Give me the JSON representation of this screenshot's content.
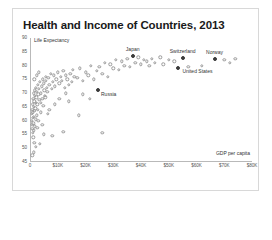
{
  "card": {
    "title": "Health and Income of Countries, 2013"
  },
  "chart_data": {
    "type": "scatter",
    "title": "Health and Income of Countries, 2013",
    "xlabel": "GDP per capita",
    "ylabel": "Life Expectancy",
    "xlim": [
      0,
      80000
    ],
    "ylim": [
      45,
      90
    ],
    "grid": false,
    "legend": "none",
    "xticks": [
      {
        "value": 0,
        "label": "0"
      },
      {
        "value": 10000,
        "label": "$10K"
      },
      {
        "value": 20000,
        "label": "$20K"
      },
      {
        "value": 30000,
        "label": "$30K"
      },
      {
        "value": 40000,
        "label": "$40K"
      },
      {
        "value": 50000,
        "label": "$50K"
      },
      {
        "value": 60000,
        "label": "$60K"
      },
      {
        "value": 70000,
        "label": "$70K"
      },
      {
        "value": 80000,
        "label": "$80K"
      }
    ],
    "yticks": [
      {
        "value": 90,
        "label": "90"
      },
      {
        "value": 85,
        "label": "85"
      },
      {
        "value": 80,
        "label": "80"
      },
      {
        "value": 75,
        "label": "75"
      },
      {
        "value": 70,
        "label": "70"
      },
      {
        "value": 65,
        "label": "65"
      },
      {
        "value": 60,
        "label": "60"
      },
      {
        "value": 55,
        "label": "55"
      },
      {
        "value": 50,
        "label": "50"
      },
      {
        "value": 45,
        "label": "45"
      }
    ],
    "annotations": [
      {
        "name": "Japan",
        "x": 37000,
        "y": 83.5,
        "dx": 0,
        "dy": -6,
        "align": "center"
      },
      {
        "name": "Switzerland",
        "x": 55000,
        "y": 82.8,
        "dx": 0,
        "dy": -6,
        "align": "center"
      },
      {
        "name": "Norway",
        "x": 66500,
        "y": 82.5,
        "dx": 0,
        "dy": -6,
        "align": "center"
      },
      {
        "name": "United States",
        "x": 53500,
        "y": 79.0,
        "dx": 4,
        "dy": 4,
        "align": "left"
      },
      {
        "name": "Russia",
        "x": 24500,
        "y": 71.0,
        "dx": 3,
        "dy": 5,
        "align": "left"
      }
    ],
    "points": [
      {
        "x": 700,
        "y": 62.5
      },
      {
        "x": 750,
        "y": 60.0
      },
      {
        "x": 800,
        "y": 58.5
      },
      {
        "x": 850,
        "y": 64.0
      },
      {
        "x": 900,
        "y": 57.0
      },
      {
        "x": 950,
        "y": 61.0
      },
      {
        "x": 1000,
        "y": 66.0
      },
      {
        "x": 1050,
        "y": 55.5
      },
      {
        "x": 1100,
        "y": 63.0
      },
      {
        "x": 1150,
        "y": 59.0
      },
      {
        "x": 1200,
        "y": 68.0
      },
      {
        "x": 1250,
        "y": 54.0
      },
      {
        "x": 1300,
        "y": 65.0
      },
      {
        "x": 1350,
        "y": 61.5
      },
      {
        "x": 1400,
        "y": 70.0
      },
      {
        "x": 1450,
        "y": 56.5
      },
      {
        "x": 1500,
        "y": 67.0
      },
      {
        "x": 1550,
        "y": 52.0
      },
      {
        "x": 1600,
        "y": 63.5
      },
      {
        "x": 1650,
        "y": 69.0
      },
      {
        "x": 1700,
        "y": 58.0
      },
      {
        "x": 1800,
        "y": 71.0
      },
      {
        "x": 1900,
        "y": 64.5
      },
      {
        "x": 2000,
        "y": 66.5
      },
      {
        "x": 2100,
        "y": 60.5
      },
      {
        "x": 2200,
        "y": 72.0
      },
      {
        "x": 2300,
        "y": 68.5
      },
      {
        "x": 2400,
        "y": 62.0
      },
      {
        "x": 2500,
        "y": 70.5
      },
      {
        "x": 2600,
        "y": 57.5
      },
      {
        "x": 2700,
        "y": 66.0
      },
      {
        "x": 2800,
        "y": 73.0
      },
      {
        "x": 2900,
        "y": 64.0
      },
      {
        "x": 3000,
        "y": 69.5
      },
      {
        "x": 3200,
        "y": 71.5
      },
      {
        "x": 3400,
        "y": 67.5
      },
      {
        "x": 3600,
        "y": 74.0
      },
      {
        "x": 3800,
        "y": 63.0
      },
      {
        "x": 4000,
        "y": 70.0
      },
      {
        "x": 4200,
        "y": 72.5
      },
      {
        "x": 4400,
        "y": 68.0
      },
      {
        "x": 4600,
        "y": 75.0
      },
      {
        "x": 4800,
        "y": 65.5
      },
      {
        "x": 5000,
        "y": 73.5
      },
      {
        "x": 5200,
        "y": 71.0
      },
      {
        "x": 5400,
        "y": 69.0
      },
      {
        "x": 5600,
        "y": 76.0
      },
      {
        "x": 5800,
        "y": 74.5
      },
      {
        "x": 6000,
        "y": 72.0
      },
      {
        "x": 6300,
        "y": 70.5
      },
      {
        "x": 6600,
        "y": 75.5
      },
      {
        "x": 7000,
        "y": 73.0
      },
      {
        "x": 7400,
        "y": 77.0
      },
      {
        "x": 7800,
        "y": 71.5
      },
      {
        "x": 8200,
        "y": 74.0
      },
      {
        "x": 8600,
        "y": 76.5
      },
      {
        "x": 9000,
        "y": 72.5
      },
      {
        "x": 9500,
        "y": 75.0
      },
      {
        "x": 10000,
        "y": 77.5
      },
      {
        "x": 10500,
        "y": 73.5
      },
      {
        "x": 11000,
        "y": 76.0
      },
      {
        "x": 11500,
        "y": 74.5
      },
      {
        "x": 12000,
        "y": 78.0
      },
      {
        "x": 12500,
        "y": 72.0
      },
      {
        "x": 13000,
        "y": 76.5
      },
      {
        "x": 13500,
        "y": 75.0
      },
      {
        "x": 14000,
        "y": 73.0
      },
      {
        "x": 14500,
        "y": 77.0
      },
      {
        "x": 15000,
        "y": 74.0
      },
      {
        "x": 15500,
        "y": 78.5
      },
      {
        "x": 16000,
        "y": 76.0
      },
      {
        "x": 17000,
        "y": 75.5
      },
      {
        "x": 18000,
        "y": 79.0
      },
      {
        "x": 19000,
        "y": 74.5
      },
      {
        "x": 20000,
        "y": 77.5
      },
      {
        "x": 21000,
        "y": 76.5
      },
      {
        "x": 22000,
        "y": 80.0
      },
      {
        "x": 23000,
        "y": 75.0
      },
      {
        "x": 24000,
        "y": 78.0
      },
      {
        "x": 25000,
        "y": 79.5
      },
      {
        "x": 26000,
        "y": 77.0
      },
      {
        "x": 27000,
        "y": 81.0
      },
      {
        "x": 28000,
        "y": 76.0
      },
      {
        "x": 29000,
        "y": 80.5
      },
      {
        "x": 30000,
        "y": 79.0
      },
      {
        "x": 31000,
        "y": 82.0
      },
      {
        "x": 32000,
        "y": 78.5
      },
      {
        "x": 33000,
        "y": 81.5
      },
      {
        "x": 34000,
        "y": 80.0
      },
      {
        "x": 35000,
        "y": 82.5
      },
      {
        "x": 36000,
        "y": 79.5
      },
      {
        "x": 38000,
        "y": 81.0
      },
      {
        "x": 39000,
        "y": 83.0
      },
      {
        "x": 40000,
        "y": 80.5
      },
      {
        "x": 41000,
        "y": 82.0
      },
      {
        "x": 42000,
        "y": 81.5
      },
      {
        "x": 43000,
        "y": 80.0
      },
      {
        "x": 44000,
        "y": 82.5
      },
      {
        "x": 45000,
        "y": 81.0
      },
      {
        "x": 47000,
        "y": 83.0
      },
      {
        "x": 48000,
        "y": 80.5
      },
      {
        "x": 50000,
        "y": 82.0
      },
      {
        "x": 52000,
        "y": 81.5
      },
      {
        "x": 57000,
        "y": 79.5
      },
      {
        "x": 62000,
        "y": 80.0
      },
      {
        "x": 70000,
        "y": 82.0
      },
      {
        "x": 72000,
        "y": 81.0
      },
      {
        "x": 74000,
        "y": 82.5
      },
      {
        "x": 2000,
        "y": 50.5
      },
      {
        "x": 3500,
        "y": 51.5
      },
      {
        "x": 1400,
        "y": 48.5
      },
      {
        "x": 900,
        "y": 47.5
      },
      {
        "x": 5000,
        "y": 55.0
      },
      {
        "x": 8000,
        "y": 54.5
      },
      {
        "x": 12000,
        "y": 56.0
      },
      {
        "x": 17500,
        "y": 62.0
      },
      {
        "x": 26000,
        "y": 55.5
      },
      {
        "x": 14000,
        "y": 67.0
      },
      {
        "x": 19000,
        "y": 69.5
      },
      {
        "x": 21500,
        "y": 68.0
      },
      {
        "x": 3000,
        "y": 60.0
      },
      {
        "x": 4500,
        "y": 58.5
      },
      {
        "x": 6500,
        "y": 62.5
      },
      {
        "x": 9000,
        "y": 66.0
      },
      {
        "x": 1600,
        "y": 75.0
      },
      {
        "x": 2400,
        "y": 76.5
      },
      {
        "x": 3200,
        "y": 77.5
      },
      {
        "x": 4000,
        "y": 66.5
      },
      {
        "x": 5500,
        "y": 68.5
      },
      {
        "x": 7000,
        "y": 64.0
      },
      {
        "x": 10500,
        "y": 68.0
      },
      {
        "x": 13000,
        "y": 70.0
      }
    ],
    "highlighted": [
      {
        "name": "Japan",
        "x": 37000,
        "y": 83.5
      },
      {
        "name": "Switzerland",
        "x": 55000,
        "y": 82.8
      },
      {
        "name": "Norway",
        "x": 66500,
        "y": 82.5
      },
      {
        "name": "United States",
        "x": 53500,
        "y": 79.0
      },
      {
        "name": "Russia",
        "x": 24500,
        "y": 71.0
      }
    ],
    "colors": {
      "point": "#9a9a9a",
      "highlight": "#3b3b3b",
      "axis": "#b9b9b9",
      "text": "#333333"
    }
  }
}
